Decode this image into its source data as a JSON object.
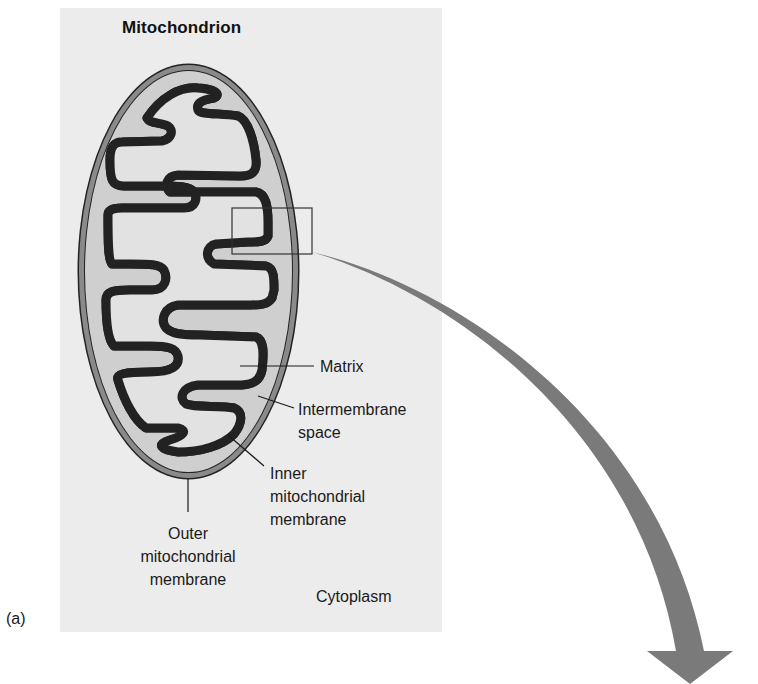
{
  "figure": {
    "panel_label": "(a)",
    "title": "Mitochondrion",
    "colors": {
      "panel_background": "#ececec",
      "outer_membrane": "#8a8a8a",
      "intermembrane_space": "#cfcfcf",
      "inner_membrane": "#9a9a9a",
      "matrix": "#e2e2e2",
      "outline": "#222222",
      "arrow": "#7a7a7a"
    }
  },
  "labels": {
    "matrix": "Matrix",
    "intermembrane": [
      "Intermembrane",
      "space"
    ],
    "inner_membrane": [
      "Inner",
      "mitochondrial",
      "membrane"
    ],
    "outer_membrane": [
      "Outer",
      "mitochondrial",
      "membrane"
    ],
    "cytoplasm": "Cytoplasm"
  },
  "callouts": {
    "zoom_box": "magnified region of inner membrane",
    "arrow": "points to enlarged view"
  }
}
